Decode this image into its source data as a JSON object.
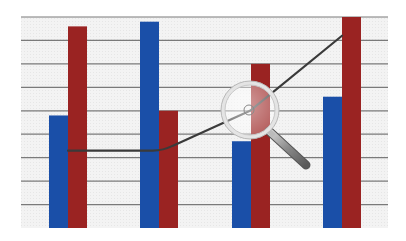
{
  "chart_data": {
    "type": "bar",
    "title": "",
    "xlabel": "",
    "ylabel": "",
    "categories": [
      "",
      "",
      "",
      ""
    ],
    "series": [
      {
        "name": "blue",
        "color": "#1a4fa8",
        "values": [
          4.8,
          8.8,
          3.7,
          5.6
        ]
      },
      {
        "name": "red",
        "color": "#9a2322",
        "values": [
          8.6,
          5.0,
          7.0,
          9.0
        ]
      }
    ],
    "line_overlay": {
      "name": "trend",
      "color": "#3a3a3a",
      "values": [
        3.3,
        3.3,
        5.0,
        8.2
      ]
    },
    "ylim": [
      0,
      9
    ],
    "grid": true,
    "gridlines": 9,
    "legend": "none",
    "annotations": [
      "magnifying-glass over third category"
    ]
  },
  "style": {
    "panel_bg": "#f2f2f2",
    "grid_color": "#7a7a7a",
    "page_bg": "#ffffff"
  }
}
